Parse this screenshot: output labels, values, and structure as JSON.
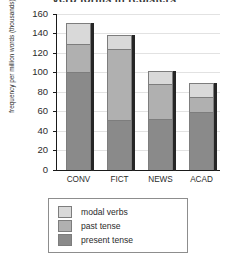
{
  "chart_data": {
    "type": "bar",
    "subtype": "stacked-bar",
    "title": "verb forms in registers",
    "xlabel": "",
    "ylabel": "frequency per million words (thousands)",
    "categories": [
      "CONV",
      "FICT",
      "NEWS",
      "ACAD"
    ],
    "ylim": [
      0,
      160
    ],
    "yticks": [
      0,
      20,
      40,
      60,
      80,
      100,
      120,
      140,
      160
    ],
    "ytick_labels": [
      "0",
      "20",
      "40",
      "60",
      "80",
      "100",
      "120",
      "140",
      "160"
    ],
    "grid": true,
    "grid_axis": "y",
    "legend_position": "below-axes",
    "series": [
      {
        "name": "present tense",
        "color": "#8a8a8a",
        "values": [
          100,
          51,
          52,
          59
        ]
      },
      {
        "name": "past tense",
        "color": "#b0b0b0",
        "values": [
          29,
          73,
          36,
          16
        ]
      },
      {
        "name": "modal verbs",
        "color": "#d9d9d9",
        "values": [
          22,
          14,
          13,
          14
        ]
      }
    ],
    "totals": [
      151,
      138,
      101,
      89
    ]
  },
  "legend": {
    "entries": [
      {
        "label": "modal verbs",
        "color": "#d9d9d9"
      },
      {
        "label": "past tense",
        "color": "#b0b0b0"
      },
      {
        "label": "present tense",
        "color": "#8a8a8a"
      }
    ]
  }
}
